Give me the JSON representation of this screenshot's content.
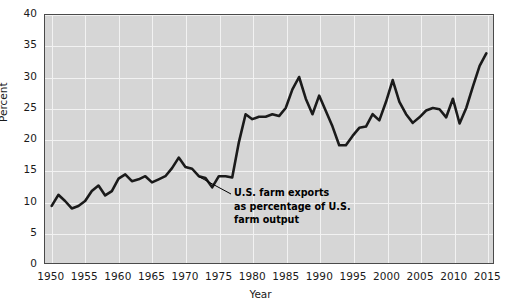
{
  "chart_data": {
    "type": "line",
    "title": "",
    "xlabel": "Year",
    "ylabel": "Percent",
    "xlim": [
      1949,
      2016
    ],
    "ylim": [
      0,
      40
    ],
    "ytick_labels": [
      "0",
      "5",
      "10",
      "15",
      "20",
      "25",
      "30",
      "35",
      "40"
    ],
    "ytick_values": [
      0,
      5,
      10,
      15,
      20,
      25,
      30,
      35,
      40
    ],
    "xtick_labels": [
      "1950",
      "1955",
      "1960",
      "1965",
      "1970",
      "1975",
      "1980",
      "1985",
      "1990",
      "1995",
      "2000",
      "2005",
      "2010",
      "2015"
    ],
    "xtick_values": [
      1950,
      1955,
      1960,
      1965,
      1970,
      1975,
      1980,
      1985,
      1990,
      1995,
      2000,
      2005,
      2010,
      2015
    ],
    "grid": true,
    "legend_position": "none",
    "series": [
      {
        "name": "U.S. farm exports as percentage of U.S. farm output",
        "x": [
          1950,
          1951,
          1952,
          1953,
          1954,
          1955,
          1956,
          1957,
          1958,
          1959,
          1960,
          1961,
          1962,
          1963,
          1964,
          1965,
          1966,
          1967,
          1968,
          1969,
          1970,
          1971,
          1972,
          1973,
          1974,
          1975,
          1976,
          1977,
          1978,
          1979,
          1980,
          1981,
          1982,
          1983,
          1984,
          1985,
          1986,
          1987,
          1988,
          1989,
          1990,
          1991,
          1992,
          1993,
          1994,
          1995,
          1996,
          1997,
          1998,
          1999,
          2000,
          2001,
          2002,
          2003,
          2004,
          2005,
          2006,
          2007,
          2008,
          2009,
          2010,
          2011,
          2012,
          2013,
          2014,
          2015
        ],
        "y": [
          9.2,
          11.0,
          10.0,
          8.8,
          9.2,
          10.0,
          11.6,
          12.5,
          10.9,
          11.6,
          13.6,
          14.3,
          13.2,
          13.5,
          14.0,
          13.0,
          13.5,
          14.0,
          15.3,
          17.0,
          15.5,
          15.2,
          14.0,
          13.7,
          12.2,
          14.0,
          14.0,
          13.8,
          19.5,
          24.0,
          23.2,
          23.6,
          23.6,
          24.0,
          23.7,
          25.0,
          28.0,
          30.0,
          26.5,
          24.0,
          27.0,
          24.5,
          22.0,
          19.0,
          19.0,
          20.5,
          21.8,
          22.0,
          24.0,
          23.0,
          26.0,
          29.5,
          26.0,
          24.0,
          22.6,
          23.5,
          24.6,
          25.0,
          24.8,
          23.5,
          26.5,
          22.5,
          25.0,
          28.5,
          31.8,
          33.8
        ]
      }
    ],
    "annotation": {
      "lines": [
        "U.S. farm exports",
        "as percentage of U.S.",
        "farm output"
      ],
      "points_to_year": 1972,
      "points_to_value": 14.0
    },
    "colors": {
      "line": "#1a1a1a",
      "plot_background": "#d6d6d6",
      "gridline": "#f2f2f2",
      "axis_border": "#4a4a4a",
      "text": "#1a1a1a",
      "page_background": "#ffffff"
    }
  }
}
